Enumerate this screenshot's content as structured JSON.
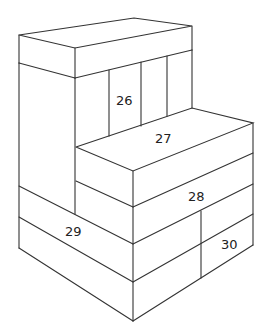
{
  "diagram": {
    "type": "isometric block stack drawing",
    "stroke_color": "#333333",
    "background": "#ffffff",
    "labels": [
      {
        "id": "block-26",
        "text": "26",
        "x": 124,
        "y": 105
      },
      {
        "id": "block-27",
        "text": "27",
        "x": 163,
        "y": 143
      },
      {
        "id": "block-28",
        "text": "28",
        "x": 196,
        "y": 201
      },
      {
        "id": "block-29",
        "text": "29",
        "x": 73,
        "y": 236
      },
      {
        "id": "block-30",
        "text": "30",
        "x": 229,
        "y": 249
      }
    ]
  }
}
